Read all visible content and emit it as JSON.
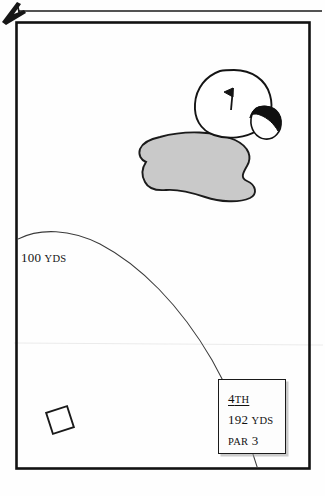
{
  "page": {
    "kind": "golf-yardage-book-hole-diagram",
    "corner_mark": "arrow-mark",
    "background_color": "#fefefe",
    "frame_color": "#111111"
  },
  "hole_info": {
    "number_label": "4",
    "number_suffix": "TH",
    "distance_value": "192",
    "distance_unit": "YDS",
    "par_label": "PAR",
    "par_value": "3"
  },
  "arc": {
    "distance_value": "100",
    "distance_unit": "YDS"
  },
  "features": {
    "green_label": "putting-green",
    "flag_label": "pin-flag",
    "greenside_bunker_label": "greenside-bunker",
    "fairway_bunker_label": "fairway-bunker",
    "fairway_bunker_fill": "#c9c9c9",
    "tee_box_label": "tee-box-marker"
  }
}
